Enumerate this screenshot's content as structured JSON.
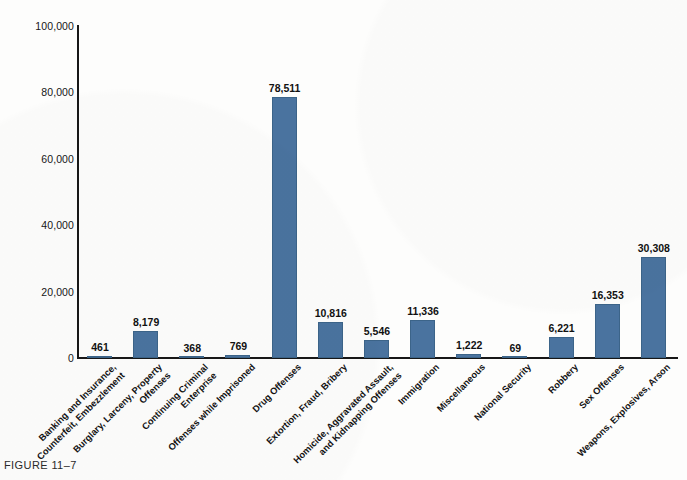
{
  "caption": "FIGURE 11–7",
  "colors": {
    "bar_fill": "#4a739f",
    "bar_stroke": "#3c6489",
    "axis": "#171717",
    "text": "#121212",
    "background": "#fdfdfc"
  },
  "chart_data": {
    "type": "bar",
    "title": "",
    "subtitle": "",
    "xlabel": "",
    "ylabel": "",
    "ylim": [
      0,
      100000
    ],
    "yticks": [
      "0",
      "20,000",
      "40,000",
      "60,000",
      "80,000",
      "100,000"
    ],
    "ytick_values": [
      0,
      20000,
      40000,
      60000,
      80000,
      100000
    ],
    "grid": false,
    "legend": false,
    "legend_position": "none",
    "label_rotation_deg": -45,
    "categories": [
      "Banking and Insurance, Counterfeit, Embezzlement",
      "Burglary, Larceny, Property Offenses",
      "Continuing Criminal Enterprise",
      "Offenses while Imprisoned",
      "Drug Offenses",
      "Extortion, Fraud, Bribery",
      "Homicide, Aggravated Assault, and Kidnapping Offenses",
      "Immigration",
      "Miscellaneous",
      "National Security",
      "Robbery",
      "Sex Offenses",
      "Weapons, Explosives, Arson"
    ],
    "category_lines": [
      [
        "Banking and Insurance,",
        "Counterfeit, Embezzlement"
      ],
      [
        "Burglary, Larceny, Property",
        "Offenses"
      ],
      [
        "Continuing Criminal",
        "Enterprise"
      ],
      [
        "Offenses while Imprisoned"
      ],
      [
        "Drug Offenses"
      ],
      [
        "Extortion, Fraud, Bribery"
      ],
      [
        "Homicide, Aggravated Assault,",
        "and Kidnapping Offenses"
      ],
      [
        "Immigration"
      ],
      [
        "Miscellaneous"
      ],
      [
        "National Security"
      ],
      [
        "Robbery"
      ],
      [
        "Sex Offenses"
      ],
      [
        "Weapons, Explosives, Arson"
      ]
    ],
    "values": [
      461,
      8179,
      368,
      769,
      78511,
      10816,
      5546,
      11336,
      1222,
      69,
      6221,
      16353,
      30308
    ],
    "value_labels": [
      "461",
      "8,179",
      "368",
      "769",
      "78,511",
      "10,816",
      "5,546",
      "11,336",
      "1,222",
      "69",
      "6,221",
      "16,353",
      "30,308"
    ]
  }
}
